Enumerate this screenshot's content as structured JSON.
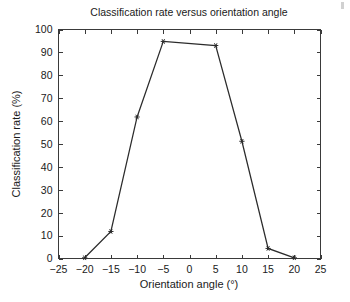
{
  "chart_data": {
    "type": "line",
    "title": "Classification rate versus orientation angle",
    "xlabel": "Orientation angle (°)",
    "ylabel": "Classification rate (%)",
    "x": [
      -20,
      -15,
      -10,
      -5,
      5,
      10,
      15,
      20
    ],
    "values": [
      0.3,
      11.8,
      61.8,
      94.8,
      93.0,
      51.2,
      4.4,
      0.3
    ],
    "series": [
      {
        "name": "Classification rate",
        "x": [
          -20,
          -15,
          -10,
          -5,
          5,
          10,
          15,
          20
        ],
        "values": [
          0.3,
          11.8,
          61.8,
          94.8,
          93.0,
          51.2,
          4.4,
          0.3
        ]
      }
    ],
    "xlim": [
      -25,
      25
    ],
    "ylim": [
      0,
      100
    ],
    "xticks": [
      -25,
      -20,
      -15,
      -10,
      -5,
      0,
      5,
      10,
      15,
      20,
      25
    ],
    "yticks": [
      0,
      10,
      20,
      30,
      40,
      50,
      60,
      70,
      80,
      90,
      100
    ],
    "xtick_labels": [
      "−25",
      "−20",
      "−15",
      "−10",
      "−5",
      "0",
      "5",
      "10",
      "15",
      "20",
      "25"
    ],
    "ytick_labels": [
      "0",
      "10",
      "20",
      "30",
      "40",
      "50",
      "60",
      "70",
      "80",
      "90",
      "100"
    ],
    "grid": false,
    "legend": null,
    "legend_position": "none",
    "marker": "star",
    "line_color": "#2b2b2b",
    "axis_color": "#3a3a3a",
    "background_color": "#ffffff"
  }
}
